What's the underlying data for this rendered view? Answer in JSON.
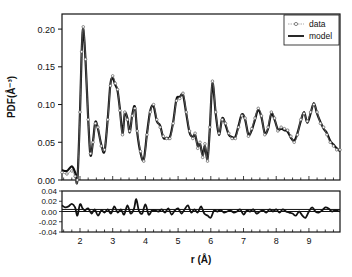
{
  "chart_data": {
    "type": "line",
    "title": "",
    "xlabel": "r (Å)",
    "ylabel": "PDF(Å⁻³)",
    "xlim": [
      1.45,
      9.95
    ],
    "ylim": [
      0.0,
      0.22
    ],
    "xticks": [
      2,
      3,
      4,
      5,
      6,
      7,
      8,
      9
    ],
    "xtick_labels": [
      "2",
      "3",
      "4",
      "5",
      "6",
      "7",
      "8",
      "9"
    ],
    "yticks": [
      0.0,
      0.05,
      0.1,
      0.15,
      0.2
    ],
    "ytick_labels": [
      "0.00",
      "0.05",
      "0.10",
      "0.15",
      "0.20"
    ],
    "legend": {
      "position": "top-right",
      "entries": [
        "data",
        "model"
      ]
    },
    "grid": false,
    "series": [
      {
        "name": "data",
        "style": "open-circle markers with thin line",
        "x": [
          1.45,
          1.6,
          1.75,
          1.85,
          1.92,
          2.0,
          2.05,
          2.1,
          2.17,
          2.25,
          2.32,
          2.4,
          2.47,
          2.55,
          2.65,
          2.75,
          2.85,
          2.93,
          3.0,
          3.08,
          3.15,
          3.22,
          3.3,
          3.37,
          3.45,
          3.52,
          3.6,
          3.68,
          3.75,
          3.85,
          3.95,
          4.05,
          4.15,
          4.25,
          4.35,
          4.45,
          4.55,
          4.65,
          4.75,
          4.85,
          4.95,
          5.05,
          5.15,
          5.25,
          5.35,
          5.45,
          5.52,
          5.6,
          5.67,
          5.75,
          5.82,
          5.9,
          5.97,
          6.05,
          6.15,
          6.25,
          6.35,
          6.45,
          6.55,
          6.65,
          6.75,
          6.85,
          6.95,
          7.05,
          7.15,
          7.25,
          7.35,
          7.45,
          7.55,
          7.65,
          7.75,
          7.85,
          7.95,
          8.05,
          8.15,
          8.25,
          8.35,
          8.45,
          8.55,
          8.65,
          8.75,
          8.85,
          8.95,
          9.05,
          9.15,
          9.25,
          9.35,
          9.45,
          9.55,
          9.65,
          9.75,
          9.85,
          9.95
        ],
        "y": [
          0.01,
          0.008,
          0.012,
          0.005,
          0.0,
          0.09,
          0.17,
          0.203,
          0.16,
          0.08,
          0.035,
          0.05,
          0.075,
          0.07,
          0.045,
          0.04,
          0.08,
          0.125,
          0.138,
          0.128,
          0.12,
          0.092,
          0.06,
          0.09,
          0.08,
          0.065,
          0.085,
          0.095,
          0.065,
          0.038,
          0.025,
          0.06,
          0.09,
          0.1,
          0.08,
          0.07,
          0.058,
          0.055,
          0.055,
          0.075,
          0.105,
          0.108,
          0.115,
          0.09,
          0.065,
          0.055,
          0.062,
          0.042,
          0.05,
          0.03,
          0.048,
          0.025,
          0.07,
          0.131,
          0.09,
          0.062,
          0.08,
          0.075,
          0.062,
          0.055,
          0.055,
          0.07,
          0.085,
          0.082,
          0.058,
          0.068,
          0.082,
          0.095,
          0.085,
          0.06,
          0.07,
          0.09,
          0.082,
          0.065,
          0.07,
          0.068,
          0.066,
          0.058,
          0.05,
          0.06,
          0.08,
          0.088,
          0.078,
          0.09,
          0.1,
          0.09,
          0.075,
          0.07,
          0.06,
          0.05,
          0.045,
          0.04,
          0.04
        ]
      },
      {
        "name": "model",
        "style": "thick solid line",
        "x": [
          1.45,
          1.6,
          1.75,
          1.85,
          1.92,
          2.0,
          2.05,
          2.1,
          2.17,
          2.25,
          2.32,
          2.4,
          2.47,
          2.55,
          2.65,
          2.75,
          2.85,
          2.93,
          3.0,
          3.08,
          3.15,
          3.22,
          3.3,
          3.37,
          3.45,
          3.52,
          3.6,
          3.68,
          3.75,
          3.85,
          3.95,
          4.05,
          4.15,
          4.25,
          4.35,
          4.45,
          4.55,
          4.65,
          4.75,
          4.85,
          4.95,
          5.05,
          5.15,
          5.25,
          5.35,
          5.45,
          5.52,
          5.6,
          5.67,
          5.75,
          5.82,
          5.9,
          5.97,
          6.05,
          6.15,
          6.25,
          6.35,
          6.45,
          6.55,
          6.65,
          6.75,
          6.85,
          6.95,
          7.05,
          7.15,
          7.25,
          7.35,
          7.45,
          7.55,
          7.65,
          7.75,
          7.85,
          7.95,
          8.05,
          8.15,
          8.25,
          8.35,
          8.45,
          8.55,
          8.65,
          8.75,
          8.85,
          8.95,
          9.05,
          9.15,
          9.25,
          9.35,
          9.45,
          9.55,
          9.65,
          9.75,
          9.85,
          9.95
        ],
        "y": [
          0.013,
          0.012,
          0.018,
          0.01,
          0.0,
          0.09,
          0.168,
          0.2,
          0.158,
          0.082,
          0.033,
          0.052,
          0.077,
          0.068,
          0.047,
          0.038,
          0.082,
          0.127,
          0.135,
          0.126,
          0.118,
          0.094,
          0.062,
          0.088,
          0.082,
          0.063,
          0.087,
          0.097,
          0.063,
          0.036,
          0.027,
          0.062,
          0.092,
          0.098,
          0.078,
          0.072,
          0.056,
          0.056,
          0.057,
          0.077,
          0.107,
          0.11,
          0.113,
          0.088,
          0.063,
          0.057,
          0.06,
          0.045,
          0.048,
          0.033,
          0.045,
          0.028,
          0.068,
          0.128,
          0.088,
          0.06,
          0.082,
          0.073,
          0.06,
          0.057,
          0.057,
          0.072,
          0.087,
          0.08,
          0.06,
          0.066,
          0.08,
          0.093,
          0.083,
          0.062,
          0.068,
          0.088,
          0.08,
          0.067,
          0.068,
          0.066,
          0.064,
          0.056,
          0.052,
          0.062,
          0.078,
          0.09,
          0.076,
          0.088,
          0.102,
          0.088,
          0.077,
          0.068,
          0.062,
          0.052,
          0.047,
          0.042,
          0.038
        ]
      }
    ],
    "residual": {
      "ylim": [
        -0.04,
        0.04
      ],
      "yticks": [
        -0.04,
        -0.02,
        0.0,
        0.02,
        0.04
      ],
      "ytick_labels": [
        "-0.04",
        "-0.02",
        "0.00",
        "0.02",
        "0.04"
      ],
      "reference_lines": [
        0.0,
        0.004
      ],
      "x": [
        1.45,
        1.55,
        1.65,
        1.75,
        1.85,
        1.92,
        2.0,
        2.08,
        2.15,
        2.25,
        2.35,
        2.45,
        2.55,
        2.65,
        2.75,
        2.85,
        2.95,
        3.05,
        3.15,
        3.25,
        3.35,
        3.45,
        3.55,
        3.65,
        3.72,
        3.8,
        3.9,
        4.0,
        4.1,
        4.2,
        4.3,
        4.4,
        4.5,
        4.6,
        4.7,
        4.8,
        4.9,
        5.0,
        5.1,
        5.2,
        5.3,
        5.4,
        5.5,
        5.6,
        5.7,
        5.8,
        5.9,
        6.0,
        6.1,
        6.2,
        6.3,
        6.4,
        6.5,
        6.6,
        6.7,
        6.8,
        6.9,
        7.0,
        7.1,
        7.2,
        7.3,
        7.4,
        7.5,
        7.6,
        7.7,
        7.8,
        7.9,
        8.0,
        8.1,
        8.2,
        8.3,
        8.4,
        8.5,
        8.6,
        8.7,
        8.8,
        8.9,
        9.0,
        9.1,
        9.2,
        9.3,
        9.4,
        9.5,
        9.6,
        9.7,
        9.8,
        9.95
      ],
      "y": [
        0.012,
        0.008,
        0.01,
        0.015,
        0.008,
        -0.008,
        0.014,
        0.006,
        0.002,
        0.006,
        -0.004,
        0.004,
        -0.008,
        0.002,
        -0.002,
        0.004,
        -0.004,
        0.01,
        -0.002,
        0.004,
        -0.006,
        0.012,
        -0.004,
        0.005,
        0.024,
        0.002,
        -0.004,
        0.014,
        -0.006,
        0.002,
        0.002,
        0.0,
        0.004,
        -0.002,
        0.006,
        -0.006,
        0.002,
        0.006,
        -0.004,
        0.004,
        0.012,
        -0.002,
        0.004,
        -0.002,
        0.01,
        -0.004,
        -0.008,
        -0.012,
        0.002,
        0.0,
        0.003,
        -0.002,
        0.0,
        0.002,
        -0.002,
        0.0,
        0.004,
        -0.006,
        0.002,
        0.0,
        0.004,
        -0.004,
        0.0,
        0.002,
        -0.002,
        0.004,
        0.0,
        0.004,
        -0.002,
        0.004,
        0.0,
        -0.002,
        -0.004,
        -0.008,
        0.0,
        -0.008,
        -0.012,
        0.0,
        0.008,
        0.0,
        -0.002,
        0.002,
        0.008,
        0.006,
        0.0,
        0.002,
        0.0
      ]
    }
  }
}
